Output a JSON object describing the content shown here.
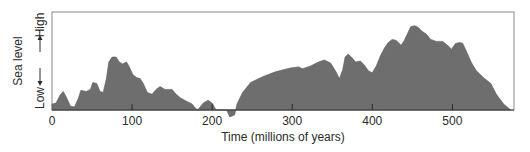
{
  "chart_data": {
    "type": "area",
    "title": "",
    "xlabel": "Time (millions of years)",
    "ylabel": "Sea level",
    "y_high_label": "High",
    "y_low_label": "Low",
    "xlim": [
      0,
      577
    ],
    "ylim": [
      0,
      100
    ],
    "y_units": "relative (0 = Low baseline, 100 = High / top of frame)",
    "grid": false,
    "legend": null,
    "x_ticks": [
      0,
      100,
      200,
      300,
      400,
      500
    ],
    "x_tick_labels": [
      "0",
      "100",
      "200",
      "300",
      "400",
      "500"
    ],
    "fill_color": "#6e6e6e",
    "frame_color": "#8a8a8a",
    "series": [
      {
        "name": "Sea level",
        "points": [
          [
            0,
            6
          ],
          [
            5,
            7
          ],
          [
            10,
            15
          ],
          [
            14,
            19
          ],
          [
            18,
            13
          ],
          [
            23,
            4
          ],
          [
            28,
            3
          ],
          [
            33,
            12
          ],
          [
            36,
            20
          ],
          [
            43,
            19
          ],
          [
            48,
            21
          ],
          [
            51,
            28
          ],
          [
            56,
            27
          ],
          [
            60,
            19
          ],
          [
            64,
            18
          ],
          [
            68,
            32
          ],
          [
            71,
            49
          ],
          [
            75,
            54
          ],
          [
            80,
            54
          ],
          [
            84,
            49
          ],
          [
            88,
            47
          ],
          [
            93,
            49
          ],
          [
            96,
            45
          ],
          [
            101,
            36
          ],
          [
            106,
            33
          ],
          [
            110,
            32
          ],
          [
            114,
            27
          ],
          [
            119,
            18
          ],
          [
            125,
            16
          ],
          [
            130,
            21
          ],
          [
            135,
            24
          ],
          [
            141,
            21
          ],
          [
            150,
            21
          ],
          [
            155,
            16
          ],
          [
            161,
            12
          ],
          [
            168,
            9
          ],
          [
            175,
            6
          ],
          [
            179,
            2
          ],
          [
            182,
            0
          ],
          [
            189,
            7
          ],
          [
            195,
            10
          ],
          [
            200,
            7
          ],
          [
            205,
            0
          ],
          [
            210,
            0
          ],
          [
            218,
            0
          ],
          [
            222,
            -7
          ],
          [
            228,
            -5
          ],
          [
            231,
            6
          ],
          [
            238,
            18
          ],
          [
            248,
            28
          ],
          [
            263,
            34
          ],
          [
            279,
            39
          ],
          [
            298,
            43
          ],
          [
            308,
            44
          ],
          [
            313,
            42
          ],
          [
            323,
            45
          ],
          [
            333,
            49
          ],
          [
            340,
            51
          ],
          [
            348,
            48
          ],
          [
            354,
            40
          ],
          [
            359,
            32
          ],
          [
            363,
            41
          ],
          [
            366,
            54
          ],
          [
            370,
            57
          ],
          [
            375,
            53
          ],
          [
            379,
            49
          ],
          [
            385,
            50
          ],
          [
            390,
            46
          ],
          [
            395,
            40
          ],
          [
            400,
            38
          ],
          [
            405,
            45
          ],
          [
            410,
            55
          ],
          [
            415,
            63
          ],
          [
            420,
            69
          ],
          [
            425,
            72
          ],
          [
            430,
            71
          ],
          [
            436,
            66
          ],
          [
            440,
            71
          ],
          [
            444,
            78
          ],
          [
            448,
            85
          ],
          [
            453,
            86
          ],
          [
            458,
            84
          ],
          [
            461,
            81
          ],
          [
            468,
            77
          ],
          [
            473,
            72
          ],
          [
            480,
            70
          ],
          [
            488,
            70
          ],
          [
            494,
            66
          ],
          [
            499,
            62
          ],
          [
            504,
            68
          ],
          [
            509,
            69
          ],
          [
            513,
            68
          ],
          [
            518,
            59
          ],
          [
            524,
            48
          ],
          [
            530,
            40
          ],
          [
            539,
            33
          ],
          [
            548,
            27
          ],
          [
            555,
            16
          ],
          [
            564,
            6
          ],
          [
            573,
            0
          ]
        ]
      }
    ]
  }
}
